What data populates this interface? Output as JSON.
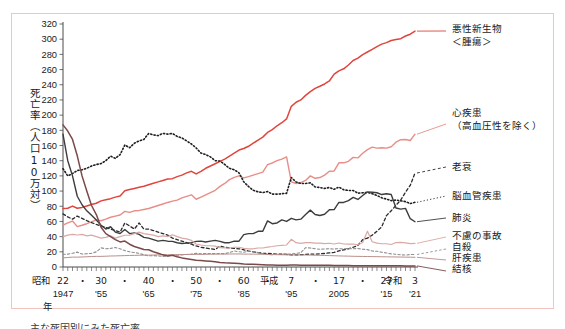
{
  "figure": {
    "border_color": "#f2c4c0",
    "background": "#ffffff",
    "y_axis_title": "死亡率（人口10万対）",
    "x_axis_title": "年",
    "era_label_showa": "昭和",
    "era_label_heisei": "平成",
    "era_label_reiwa": "令和",
    "caption_fragment": "主な死因別にみた死亡率"
  },
  "chart_data": {
    "type": "line",
    "xlabel": "年",
    "ylabel": "死亡率（人口10万対）",
    "ylim": [
      0,
      320
    ],
    "xlim": [
      1947,
      2021
    ],
    "ytick_step": 20,
    "yticks": [
      0,
      20,
      40,
      60,
      80,
      100,
      120,
      140,
      160,
      180,
      200,
      220,
      240,
      260,
      280,
      300,
      320
    ],
    "grid": false,
    "legend_position": "right",
    "x_minor_tick_interval": 1,
    "x_axis_labels": [
      {
        "era": "昭和",
        "jp_year": "22",
        "west": "1947",
        "x": 1947
      },
      {
        "era": "",
        "jp_year": "・",
        "west": "",
        "x": 1951
      },
      {
        "era": "",
        "jp_year": "30",
        "west": "'55",
        "x": 1955
      },
      {
        "era": "",
        "jp_year": "・",
        "west": "",
        "x": 1960
      },
      {
        "era": "",
        "jp_year": "40",
        "west": "'65",
        "x": 1965
      },
      {
        "era": "",
        "jp_year": "・",
        "west": "",
        "x": 1970
      },
      {
        "era": "",
        "jp_year": "50",
        "west": "'75",
        "x": 1975
      },
      {
        "era": "",
        "jp_year": "・",
        "west": "",
        "x": 1980
      },
      {
        "era": "",
        "jp_year": "60",
        "west": "'85",
        "x": 1985
      },
      {
        "era": "",
        "jp_year": "・",
        "west": "",
        "x": 1990
      },
      {
        "era": "平成",
        "jp_year": "7",
        "west": "'95",
        "x": 1995
      },
      {
        "era": "",
        "jp_year": "・",
        "west": "",
        "x": 2000
      },
      {
        "era": "",
        "jp_year": "17",
        "west": "2005",
        "x": 2005
      },
      {
        "era": "",
        "jp_year": "・",
        "west": "",
        "x": 2010
      },
      {
        "era": "",
        "jp_year": "27",
        "west": "'15",
        "x": 2015
      },
      {
        "era": "令和",
        "jp_year": "3",
        "west": "'21",
        "x": 2021
      }
    ],
    "x": [
      1947,
      1948,
      1949,
      1950,
      1951,
      1952,
      1953,
      1954,
      1955,
      1956,
      1957,
      1958,
      1959,
      1960,
      1961,
      1962,
      1963,
      1964,
      1965,
      1966,
      1967,
      1968,
      1969,
      1970,
      1971,
      1972,
      1973,
      1974,
      1975,
      1976,
      1977,
      1978,
      1979,
      1980,
      1981,
      1982,
      1983,
      1984,
      1985,
      1986,
      1987,
      1988,
      1989,
      1990,
      1991,
      1992,
      1993,
      1994,
      1995,
      1996,
      1997,
      1998,
      1999,
      2000,
      2001,
      2002,
      2003,
      2004,
      2005,
      2006,
      2007,
      2008,
      2009,
      2010,
      2011,
      2012,
      2013,
      2014,
      2015,
      2016,
      2017,
      2018,
      2019,
      2020,
      2021
    ],
    "series": [
      {
        "name": "悪性新生物＜腫瘍＞",
        "legend_label": "悪性新生物\n＜腫瘍＞",
        "color": "#e0453c",
        "style": "solid",
        "width": 1.5,
        "values": [
          76.9,
          77.4,
          80.2,
          77.4,
          78.5,
          80.3,
          82.2,
          84.0,
          87.1,
          88.5,
          90.0,
          92.0,
          93.5,
          100.4,
          102.0,
          103.5,
          104.9,
          106.3,
          108.4,
          110.3,
          112.1,
          114.0,
          115.9,
          116.3,
          119.0,
          121.0,
          124.0,
          126.0,
          122.6,
          126.0,
          130.0,
          133.0,
          136.0,
          139.1,
          142.0,
          146.0,
          150.0,
          154.0,
          156.1,
          159.0,
          163.0,
          167.0,
          171.0,
          177.2,
          181.0,
          186.0,
          190.0,
          195.0,
          211.6,
          217.0,
          220.0,
          226.0,
          231.0,
          235.2,
          238.0,
          241.0,
          245.0,
          253.9,
          258.3,
          261.0,
          266.0,
          272.0,
          275.0,
          279.7,
          283.1,
          286.6,
          290.3,
          293.5,
          295.5,
          298.3,
          299.5,
          300.7,
          304.2,
          306.6,
          310.7
        ]
      },
      {
        "name": "心疾患（高血圧性を除く）",
        "legend_label": "心疾患\n（高血圧性を除く）",
        "color": "#e88d87",
        "style": "solid",
        "width": 1.4,
        "values": [
          55.0,
          58.0,
          60.5,
          53.2,
          55.0,
          57.0,
          59.5,
          62.0,
          60.9,
          63.0,
          65.5,
          67.0,
          68.5,
          73.2,
          72.0,
          74.0,
          74.5,
          75.8,
          77.0,
          79.0,
          81.0,
          83.0,
          85.0,
          86.7,
          88.0,
          91.0,
          93.0,
          95.0,
          89.2,
          92.0,
          95.0,
          98.0,
          101.0,
          106.2,
          110.0,
          115.0,
          118.0,
          120.0,
          117.3,
          119.0,
          121.0,
          123.0,
          125.0,
          134.8,
          137.0,
          140.0,
          142.0,
          145.0,
          112.0,
          110.0,
          111.0,
          114.0,
          120.0,
          116.8,
          117.8,
          121.0,
          126.0,
          126.5,
          137.2,
          137.2,
          139.2,
          144.4,
          143.7,
          149.8,
          154.5,
          157.9,
          156.5,
          157.0,
          156.5,
          158.4,
          164.3,
          167.6,
          167.9,
          166.6,
          174.9
        ]
      },
      {
        "name": "老衰",
        "legend_label": "老衰",
        "color": "#2b2b2b",
        "style": "dashed",
        "width": 1.3,
        "values": [
          70.0,
          66.0,
          63.0,
          67.1,
          64.0,
          61.0,
          58.5,
          56.0,
          54.0,
          52.0,
          50.0,
          48.0,
          46.0,
          58.0,
          54.0,
          50.0,
          58.0,
          50.0,
          50.0,
          48.0,
          46.0,
          44.0,
          42.0,
          38.1,
          36.0,
          34.0,
          32.0,
          30.0,
          27.7,
          26.0,
          25.0,
          24.0,
          23.0,
          27.6,
          26.0,
          25.0,
          24.5,
          24.0,
          22.7,
          21.0,
          20.0,
          19.0,
          18.0,
          18.0,
          17.5,
          17.0,
          16.8,
          16.5,
          16.0,
          16.0,
          16.2,
          16.5,
          17.0,
          17.0,
          17.3,
          17.8,
          18.5,
          19.2,
          21.1,
          22.5,
          24.0,
          26.0,
          28.5,
          35.9,
          38.0,
          42.0,
          47.0,
          53.0,
          67.7,
          74.0,
          81.3,
          88.2,
          98.5,
          107.5,
          123.8
        ]
      },
      {
        "name": "脳血管疾患",
        "legend_label": "脳血管疾患",
        "color": "#1f1f1f",
        "style": "dotted",
        "width": 1.6,
        "values": [
          129.4,
          120.0,
          123.0,
          127.1,
          128.0,
          130.0,
          133.0,
          135.0,
          136.1,
          140.0,
          146.0,
          143.0,
          148.0,
          160.7,
          157.0,
          163.0,
          166.0,
          168.0,
          175.8,
          174.0,
          173.0,
          176.0,
          175.0,
          175.8,
          172.0,
          170.0,
          166.0,
          162.0,
          156.7,
          150.0,
          148.0,
          145.0,
          140.0,
          139.5,
          135.0,
          130.0,
          128.0,
          124.0,
          112.2,
          106.0,
          101.0,
          99.0,
          98.0,
          99.4,
          96.0,
          96.0,
          96.5,
          97.0,
          117.9,
          112.0,
          110.0,
          110.0,
          110.8,
          105.5,
          104.7,
          103.4,
          104.7,
          102.3,
          105.3,
          101.7,
          100.8,
          100.8,
          97.2,
          97.7,
          98.2,
          96.5,
          94.1,
          91.1,
          89.4,
          87.4,
          88.2,
          87.1,
          86.1,
          83.5,
          85.2
        ]
      },
      {
        "name": "肺炎",
        "legend_label": "肺炎",
        "color": "#3d3d3d",
        "style": "solid",
        "width": 1.4,
        "values": [
          174.8,
          140.0,
          120.0,
          93.2,
          82.0,
          74.0,
          68.0,
          62.0,
          55.0,
          50.0,
          53.0,
          46.0,
          44.0,
          49.3,
          44.0,
          45.0,
          43.0,
          39.0,
          38.1,
          36.0,
          34.0,
          35.0,
          34.0,
          33.7,
          32.0,
          31.0,
          31.5,
          32.0,
          33.7,
          34.0,
          33.0,
          34.0,
          35.0,
          33.7,
          32.0,
          32.0,
          34.0,
          34.0,
          42.7,
          44.0,
          44.0,
          47.0,
          47.0,
          60.7,
          57.0,
          58.0,
          62.0,
          60.0,
          64.1,
          62.0,
          63.0,
          69.0,
          74.9,
          69.2,
          67.8,
          69.4,
          75.3,
          75.7,
          85.0,
          85.0,
          87.4,
          91.6,
          89.0,
          94.1,
          98.9,
          98.4,
          97.8,
          95.4,
          96.5,
          95.4,
          77.7,
          76.2,
          77.2,
          63.6,
          59.6
        ]
      },
      {
        "name": "不慮の事故",
        "legend_label": "不慮の事故",
        "color": "#d9a9a5",
        "style": "solid",
        "width": 1.2,
        "values": [
          40.0,
          42.0,
          43.0,
          42.1,
          43.0,
          41.0,
          42.0,
          40.0,
          38.0,
          39.0,
          41.0,
          38.0,
          40.0,
          41.8,
          42.0,
          44.0,
          46.0,
          44.0,
          43.0,
          42.0,
          40.0,
          41.0,
          40.0,
          42.5,
          40.0,
          38.0,
          37.0,
          35.0,
          30.3,
          29.0,
          28.0,
          28.0,
          27.5,
          25.4,
          25.0,
          25.0,
          26.0,
          26.0,
          24.6,
          24.0,
          24.0,
          25.0,
          25.0,
          26.2,
          27.0,
          28.0,
          28.5,
          29.0,
          36.5,
          32.0,
          31.0,
          32.0,
          32.0,
          31.4,
          31.4,
          30.7,
          31.3,
          30.3,
          31.6,
          30.3,
          30.1,
          30.3,
          29.2,
          32.2,
          47.1,
          33.2,
          31.5,
          30.6,
          30.6,
          29.6,
          32.2,
          32.4,
          31.8,
          30.7,
          31.2
        ]
      },
      {
        "name": "自殺",
        "legend_label": "自殺",
        "color": "#8f8f8f",
        "style": "dashed",
        "width": 1.1,
        "values": [
          16.4,
          17.0,
          18.0,
          19.6,
          17.0,
          17.5,
          18.0,
          20.0,
          25.2,
          24.0,
          24.5,
          25.7,
          24.0,
          21.6,
          20.0,
          19.0,
          18.0,
          16.0,
          14.7,
          15.0,
          14.5,
          14.0,
          14.5,
          15.2,
          15.5,
          16.0,
          16.5,
          17.0,
          18.0,
          17.5,
          17.8,
          17.7,
          17.6,
          17.7,
          17.6,
          19.0,
          21.1,
          20.0,
          19.4,
          21.0,
          20.0,
          19.0,
          17.5,
          16.4,
          16.1,
          17.0,
          17.5,
          16.9,
          17.2,
          18.0,
          18.8,
          25.4,
          25.0,
          24.1,
          23.3,
          23.8,
          24.0,
          23.7,
          24.2,
          23.7,
          24.4,
          24.0,
          24.4,
          23.4,
          22.9,
          21.0,
          20.7,
          19.5,
          18.5,
          17.3,
          16.8,
          16.1,
          15.7,
          16.4,
          16.5
        ]
      },
      {
        "name": "肝疾患",
        "legend_label": "肝疾患",
        "color": "#b98f8b",
        "style": "solid",
        "width": 1.0,
        "values": [
          12.0,
          12.5,
          13.0,
          13.0,
          13.2,
          13.5,
          13.8,
          14.0,
          14.0,
          14.2,
          14.5,
          14.6,
          14.8,
          15.0,
          15.2,
          15.3,
          15.5,
          15.6,
          15.6,
          15.8,
          16.0,
          16.0,
          16.2,
          16.2,
          16.3,
          16.4,
          16.5,
          16.6,
          16.6,
          16.6,
          16.7,
          16.8,
          16.9,
          17.0,
          17.0,
          17.1,
          17.2,
          17.2,
          17.0,
          17.0,
          16.9,
          16.9,
          16.8,
          16.6,
          16.4,
          16.2,
          16.1,
          16.0,
          16.0,
          15.9,
          15.8,
          15.8,
          15.7,
          15.5,
          15.4,
          15.2,
          15.0,
          14.8,
          14.6,
          14.4,
          14.3,
          14.1,
          14.0,
          13.9,
          13.8,
          13.7,
          13.6,
          13.5,
          13.4,
          13.3,
          13.2,
          13.1,
          13.0,
          12.9,
          12.8
        ]
      },
      {
        "name": "結核",
        "legend_label": "結核",
        "color": "#7a4a48",
        "style": "solid",
        "width": 1.5,
        "values": [
          187.2,
          179.0,
          168.0,
          146.4,
          120.0,
          100.0,
          81.0,
          69.0,
          52.3,
          44.0,
          40.0,
          36.0,
          33.0,
          34.2,
          30.0,
          27.0,
          25.0,
          23.0,
          22.8,
          20.0,
          18.0,
          16.0,
          14.5,
          15.4,
          13.5,
          12.0,
          11.0,
          10.0,
          9.0,
          8.5,
          8.0,
          7.5,
          7.0,
          6.0,
          5.5,
          5.2,
          4.9,
          4.6,
          4.0,
          3.7,
          3.5,
          3.3,
          3.1,
          2.6,
          2.5,
          2.4,
          2.4,
          2.3,
          2.6,
          2.5,
          2.4,
          2.4,
          2.4,
          2.3,
          2.3,
          2.2,
          2.2,
          2.1,
          2.0,
          1.9,
          1.9,
          1.8,
          1.8,
          1.7,
          1.7,
          1.7,
          1.6,
          1.6,
          1.5,
          1.5,
          1.5,
          1.5,
          1.4,
          1.4,
          1.4
        ]
      }
    ]
  },
  "legend": [
    {
      "label_line1": "悪性新生物",
      "label_line2": "＜腫瘍＞",
      "color": "#e0453c",
      "style": "solid"
    },
    {
      "label_line1": "心疾患",
      "label_line2": "（高血圧性を除く）",
      "color": "#e88d87",
      "style": "solid"
    },
    {
      "label_line1": "老衰",
      "label_line2": "",
      "color": "#2b2b2b",
      "style": "dashed"
    },
    {
      "label_line1": "脳血管疾患",
      "label_line2": "",
      "color": "#1f1f1f",
      "style": "dotted"
    },
    {
      "label_line1": "肺炎",
      "label_line2": "",
      "color": "#3d3d3d",
      "style": "solid"
    },
    {
      "label_line1": "不慮の事故",
      "label_line2": "",
      "color": "#d9a9a5",
      "style": "solid"
    },
    {
      "label_line1": "自殺",
      "label_line2": "",
      "color": "#8f8f8f",
      "style": "dashed"
    },
    {
      "label_line1": "肝疾患",
      "label_line2": "",
      "color": "#b98f8b",
      "style": "solid"
    },
    {
      "label_line1": "結核",
      "label_line2": "",
      "color": "#7a4a48",
      "style": "solid"
    }
  ]
}
